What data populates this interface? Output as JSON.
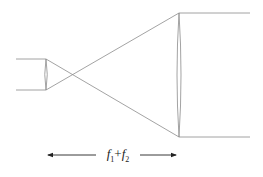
{
  "diagram": {
    "distance_label": {
      "f1": "f",
      "sub1": "1",
      "plus": "+",
      "f2": "f",
      "sub2": "2"
    },
    "colors": {
      "rays": "#8c8c8c",
      "lens": "#8c8c8c",
      "dimension_arrow": "#222222"
    },
    "elements": {
      "input_beam": {
        "x_start": 16,
        "x_end": 46,
        "y_top": 59,
        "y_bottom": 90
      },
      "lens_1": {
        "x": 46,
        "y_top": 59,
        "y_bottom": 90,
        "half_thickness": 1.5
      },
      "lens_2": {
        "x": 179,
        "y_top": 13,
        "y_bottom": 137,
        "half_thickness": 2.5
      },
      "output_beam": {
        "x_start": 179,
        "x_end": 250,
        "y_top": 13,
        "y_bottom": 137
      },
      "focal_point": {
        "x": 72,
        "y": 75
      },
      "dimension_arrow": {
        "x_start": 47,
        "x_end": 177,
        "y": 155
      }
    }
  }
}
